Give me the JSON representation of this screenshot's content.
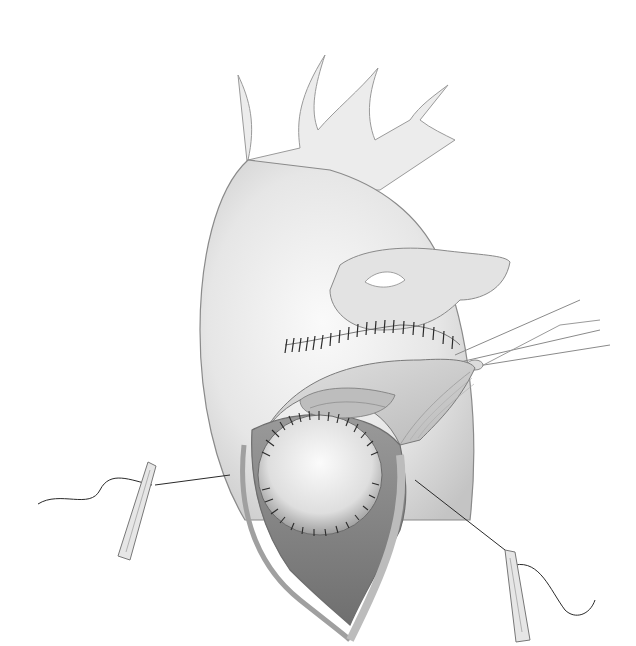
{
  "illustration": {
    "subject": "surgical illustration of heart with sutured patch through atriotomy",
    "style": "grayscale pencil drawing",
    "colors": {
      "background": "#ffffff",
      "tissue_light": "#ececec",
      "tissue_mid": "#c9c9c9",
      "tissue_dark": "#8a8a8a",
      "outline": "#6e6e6e",
      "suture": "#2a2a2a"
    },
    "elements": [
      "great-vessels",
      "aorta-body",
      "suture-line-upper",
      "retracted-flap",
      "atrial-opening",
      "sutured-patch",
      "left-stay-suture-clamp",
      "right-stay-suture-clamp",
      "upper-right-instrument"
    ]
  }
}
